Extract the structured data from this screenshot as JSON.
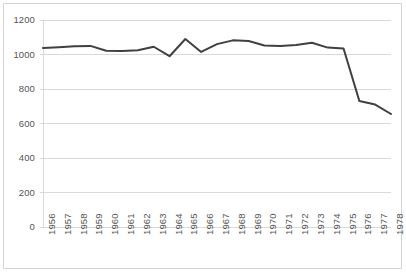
{
  "chart_data": {
    "type": "line",
    "title": "",
    "subtitle": "",
    "xlabel": "",
    "ylabel": "",
    "categories": [
      "1956",
      "1957",
      "1958",
      "1959",
      "1960",
      "1961",
      "1962",
      "1963",
      "1964",
      "1965",
      "1966",
      "1967",
      "1968",
      "1969",
      "1970",
      "1971",
      "1972",
      "1973",
      "1974",
      "1975",
      "1976",
      "1977",
      "1978"
    ],
    "values": [
      1038,
      1042,
      1048,
      1050,
      1022,
      1020,
      1025,
      1045,
      990,
      1090,
      1015,
      1060,
      1082,
      1078,
      1052,
      1050,
      1055,
      1068,
      1040,
      1035,
      730,
      710,
      655
    ],
    "series": [
      {
        "name": "series-1",
        "values": [
          1038,
          1042,
          1048,
          1050,
          1022,
          1020,
          1025,
          1045,
          990,
          1090,
          1015,
          1060,
          1082,
          1078,
          1052,
          1050,
          1055,
          1068,
          1040,
          1035,
          730,
          710,
          655
        ]
      }
    ],
    "points": [
      {
        "x": "1956",
        "y": 1038
      },
      {
        "x": "1957",
        "y": 1042
      },
      {
        "x": "1958",
        "y": 1048
      },
      {
        "x": "1959",
        "y": 1050
      },
      {
        "x": "1960",
        "y": 1022
      },
      {
        "x": "1961",
        "y": 1020
      },
      {
        "x": "1962",
        "y": 1025
      },
      {
        "x": "1963",
        "y": 1045
      },
      {
        "x": "1964",
        "y": 990
      },
      {
        "x": "1965",
        "y": 1090
      },
      {
        "x": "1966",
        "y": 1015
      },
      {
        "x": "1967",
        "y": 1060
      },
      {
        "x": "1968",
        "y": 1082
      },
      {
        "x": "1969",
        "y": 1078
      },
      {
        "x": "1970",
        "y": 1052
      },
      {
        "x": "1971",
        "y": 1050
      },
      {
        "x": "1972",
        "y": 1055
      },
      {
        "x": "1973",
        "y": 1068
      },
      {
        "x": "1974",
        "y": 1040
      },
      {
        "x": "1975",
        "y": 1035
      },
      {
        "x": "1976",
        "y": 730
      },
      {
        "x": "1977",
        "y": 710
      },
      {
        "x": "1978",
        "y": 655
      }
    ],
    "ylim": [
      0,
      1200
    ],
    "yticks": [
      0,
      200,
      400,
      600,
      800,
      1000,
      1200
    ],
    "ytick_labels": [
      "0",
      "200",
      "400",
      "600",
      "800",
      "1000",
      "1200"
    ],
    "xtick_labels": [
      "1956",
      "1957",
      "1958",
      "1959",
      "1960",
      "1961",
      "1962",
      "1963",
      "1964",
      "1965",
      "1966",
      "1967",
      "1968",
      "1969",
      "1970",
      "1971",
      "1972",
      "1973",
      "1974",
      "1975",
      "1976",
      "1977",
      "1978"
    ],
    "grid": {
      "horizontal": true,
      "vertical": false,
      "color": "#d9d9d9"
    },
    "legend": {
      "visible": false,
      "position": "none",
      "entries": []
    },
    "line_color": "#404040",
    "line_width": 2,
    "markers": false,
    "plot_background": "#ffffff",
    "border_color": "#d4d4d4",
    "tick_label_color": "#555555",
    "xtick_rotation": -90
  }
}
